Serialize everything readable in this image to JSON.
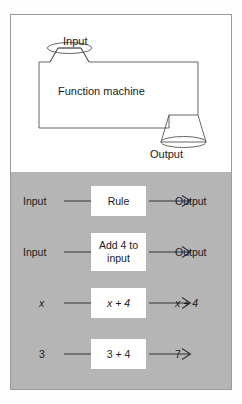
{
  "figure": {
    "machine": {
      "input_label": "Input",
      "output_label": "Output",
      "body_label": "Function machine"
    },
    "flow_rows": [
      {
        "source": "Input",
        "box": "Rule",
        "result": "Output",
        "box_lines": [
          "Rule"
        ],
        "source_italic": false,
        "result_italic": false
      },
      {
        "source": "Input",
        "box": "Add 4 to input",
        "result": "Output",
        "box_lines": [
          "Add 4 to",
          "input"
        ],
        "source_italic": false,
        "result_italic": false
      },
      {
        "source": "x",
        "box": "x + 4",
        "result": "x + 4",
        "box_lines": [
          "x + 4"
        ],
        "source_italic": true,
        "result_italic": true
      },
      {
        "source": "3",
        "box": "3 + 4",
        "result": "7",
        "box_lines": [
          "3 + 4"
        ],
        "source_italic": false,
        "result_italic": false
      }
    ]
  },
  "colors": {
    "panel_gray": "#b5b5b5",
    "box_white": "#ffffff",
    "stroke": "#555555",
    "border": "#9a9a9a",
    "text": "#1b1b1b"
  }
}
